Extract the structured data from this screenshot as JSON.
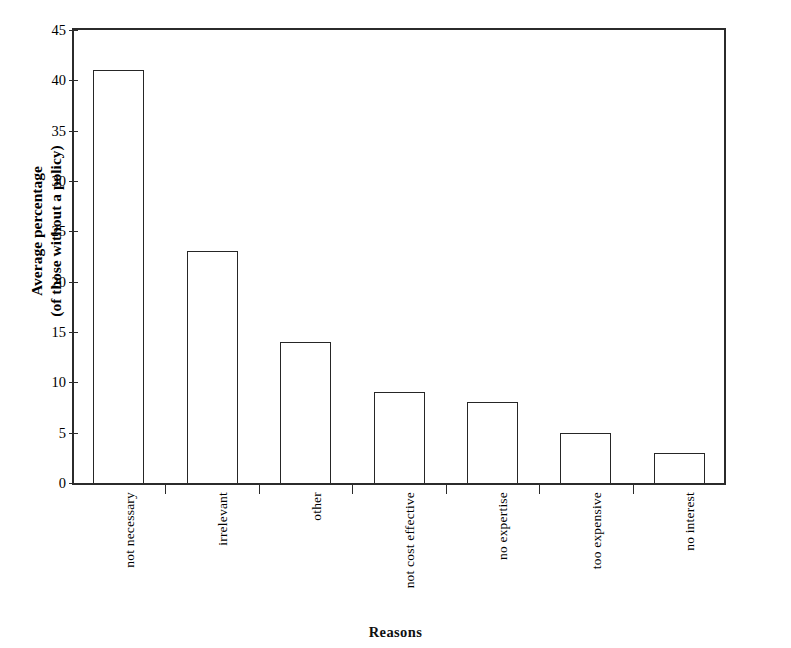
{
  "clipped_heading": "number below.",
  "chart_data": {
    "type": "bar",
    "title": "",
    "subtitle": "",
    "xlabel": "Reasons",
    "ylabel": "Average percentage (of those without a policy)",
    "ylabel_line1": "Average percentage",
    "ylabel_line2": "(of those without a policy)",
    "categories": [
      "not necessary",
      "irrelevant",
      "other",
      "not cost effective",
      "no expertise",
      "too expensive",
      "no interest"
    ],
    "values": [
      41,
      23,
      14,
      9,
      8,
      5,
      3
    ],
    "ylim": [
      0,
      45
    ],
    "ytick_values": [
      0,
      5,
      10,
      15,
      20,
      25,
      30,
      35,
      40,
      45
    ],
    "ytick_labels": [
      "0",
      "5",
      "10",
      "15",
      "20",
      "25",
      "30",
      "35",
      "40",
      "45"
    ],
    "grid": false,
    "legend": false,
    "legend_position": "none",
    "bar_fill": "#ffffff",
    "bar_edge": "#262626",
    "axis_color": "#2b2b2b",
    "background": "#ffffff"
  }
}
